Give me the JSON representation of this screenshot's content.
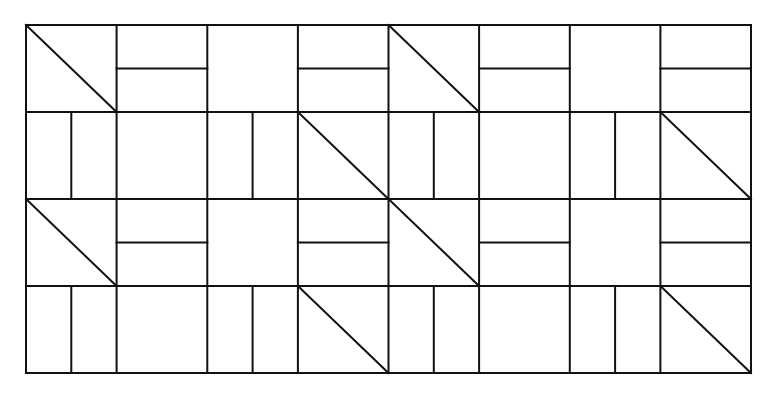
{
  "diagram": {
    "grid": {
      "x": 26,
      "y": 25,
      "width": 725,
      "height": 348,
      "columns": 8,
      "rows": 4
    },
    "stroke_color": "#111111",
    "background_color": "#ffffff",
    "tile_types": {
      "D": "diagonal-top-left-to-bottom-right",
      "H": "horizontal-midline",
      "V": "vertical-midline",
      "E": "empty"
    },
    "tiles": [
      [
        "D",
        "H",
        "E",
        "H",
        "D",
        "H",
        "E",
        "H"
      ],
      [
        "V",
        "E",
        "V",
        "D",
        "V",
        "E",
        "V",
        "D"
      ],
      [
        "D",
        "H",
        "E",
        "H",
        "D",
        "H",
        "E",
        "H"
      ],
      [
        "V",
        "E",
        "V",
        "D",
        "V",
        "E",
        "V",
        "D"
      ]
    ]
  }
}
